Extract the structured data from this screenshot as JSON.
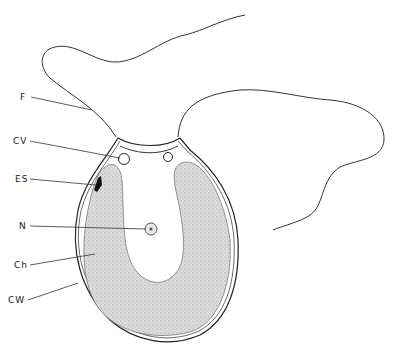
{
  "diagram": {
    "labels": [
      {
        "id": "F",
        "text": "F",
        "meaning": "flagellum"
      },
      {
        "id": "CV",
        "text": "CV",
        "meaning": "contractile vacuole"
      },
      {
        "id": "ES",
        "text": "ES",
        "meaning": "eyespot"
      },
      {
        "id": "N",
        "text": "N",
        "meaning": "nucleus"
      },
      {
        "id": "Ch",
        "text": "Ch",
        "meaning": "chloroplast"
      },
      {
        "id": "CW",
        "text": "CW",
        "meaning": "cell wall"
      }
    ],
    "colors": {
      "line": "#222222",
      "chloroplast_fill": "#d6d6d6",
      "background": "#ffffff",
      "eyespot": "#111111"
    }
  }
}
